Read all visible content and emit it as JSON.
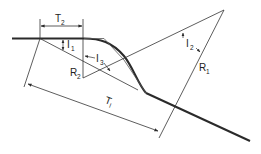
{
  "diagram": {
    "type": "compound-curve-geometry",
    "colors": {
      "line": "#2a2a2a",
      "thin_line": "#333333",
      "background": "#ffffff"
    },
    "labels": {
      "T2": {
        "main": "T",
        "sub": "2"
      },
      "I1": {
        "main": "I",
        "sub": "1"
      },
      "I3": {
        "main": "I",
        "sub": "3"
      },
      "I2": {
        "main": "I",
        "sub": "2"
      },
      "R2": {
        "main": "R",
        "sub": "2"
      },
      "R1": {
        "main": "R",
        "sub": "1"
      },
      "T1": {
        "main": "T",
        "sub": "l"
      }
    }
  }
}
